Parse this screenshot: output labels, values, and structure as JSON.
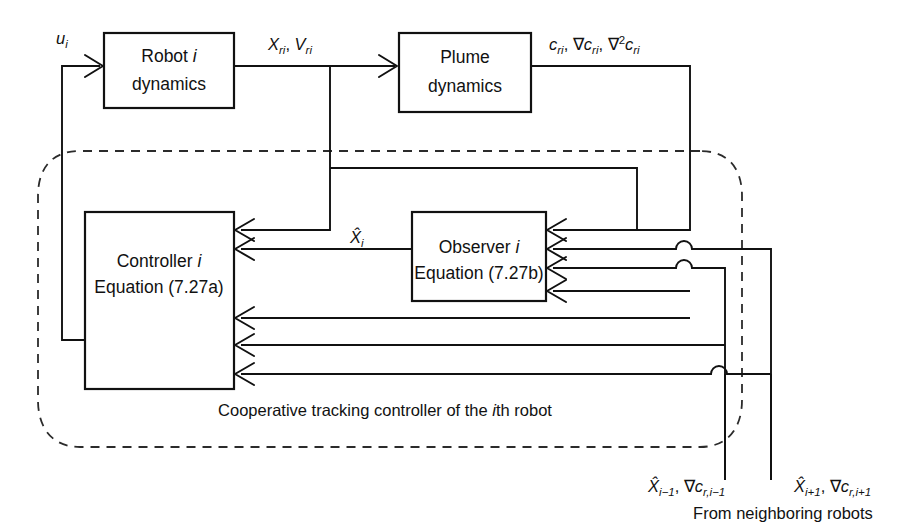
{
  "diagram": {
    "title_caption": "Cooperative tracking controller of the ith robot",
    "footer_caption": "From neighboring robots",
    "blocks": [
      {
        "id": "robot",
        "line1": "Robot i",
        "line2": "dynamics"
      },
      {
        "id": "plume",
        "line1": "Plume",
        "line2": "dynamics"
      },
      {
        "id": "controller",
        "line1": "Controller i",
        "line2": "Equation (7.27a)"
      },
      {
        "id": "observer",
        "line1": "Observer i",
        "line2": "Equation (7.27b)"
      }
    ],
    "signals": {
      "control_input": "u_i",
      "robot_state": "X_ri, V_ri",
      "plume_output": "c_ri, ∇c_ri, ∇²c_ri",
      "estimate_self": "X̂_i",
      "neighbor_prev": "X̂_{i-1}, ∇c_{r,i-1}",
      "neighbor_next": "X̂_{i+1}, ∇c_{r,i+1}"
    },
    "colors": {
      "stroke": "#111111",
      "background": "#ffffff",
      "dashed": "#2b2b2b"
    }
  }
}
